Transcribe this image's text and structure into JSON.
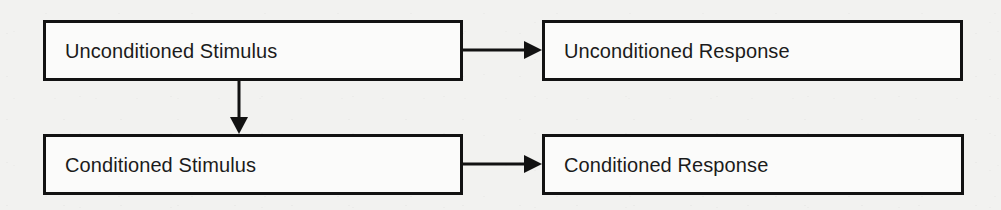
{
  "diagram": {
    "type": "flowchart",
    "background_color": "#f2f2f0",
    "box_fill_color": "#fbfbfa",
    "stroke_color": "#121212",
    "text_color": "#1b1b1b",
    "nodes": [
      {
        "id": "unconditioned-stimulus",
        "label": "Unconditioned Stimulus",
        "row": "top",
        "column": "left",
        "x": 43,
        "y": 20,
        "width": 420,
        "height": 61
      },
      {
        "id": "unconditioned-response",
        "label": "Unconditioned Response",
        "row": "top",
        "column": "right",
        "x": 542,
        "y": 20,
        "width": 421,
        "height": 61
      },
      {
        "id": "conditioned-stimulus",
        "label": "Conditioned Stimulus",
        "row": "bottom",
        "column": "left",
        "x": 43,
        "y": 134,
        "width": 420,
        "height": 61
      },
      {
        "id": "conditioned-response",
        "label": "Conditioned Response",
        "row": "bottom",
        "column": "right",
        "x": 542,
        "y": 134,
        "width": 422,
        "height": 61
      }
    ],
    "edges": [
      {
        "id": "us-to-ur",
        "from": "unconditioned-stimulus",
        "to": "unconditioned-response",
        "direction": "horizontal",
        "arrowhead": "filled-triangle"
      },
      {
        "id": "us-to-cs",
        "from": "unconditioned-stimulus",
        "to": "conditioned-stimulus",
        "direction": "vertical",
        "arrowhead": "filled-triangle"
      },
      {
        "id": "cs-to-cr",
        "from": "conditioned-stimulus",
        "to": "conditioned-response",
        "direction": "horizontal",
        "arrowhead": "filled-triangle"
      }
    ]
  }
}
